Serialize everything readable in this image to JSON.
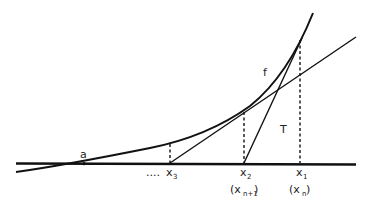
{
  "diagram": {
    "colors": {
      "stroke": "#111111",
      "text": "#222222",
      "background": "#ffffff"
    },
    "labels": {
      "root": "a",
      "function": "f",
      "tangent": "T",
      "ellipsis": "....",
      "x3": {
        "base": "x",
        "sub": "3"
      },
      "x2": {
        "base": "x",
        "sub": "2"
      },
      "x1": {
        "base": "x",
        "sub": "1"
      },
      "x2_alt": {
        "open": "(x",
        "sub": "n+1",
        "close": ")"
      },
      "x1_alt": {
        "open": "(x",
        "sub": "n",
        "close": " )"
      }
    }
  }
}
